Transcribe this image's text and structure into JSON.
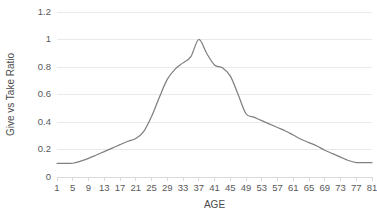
{
  "chart_data": {
    "type": "line",
    "title": "",
    "xlabel": "AGE",
    "ylabel": "Give vs Take Ratio",
    "xlim": [
      1,
      81
    ],
    "ylim": [
      0,
      1.2
    ],
    "grid": true,
    "legend": false,
    "legend_position": "none",
    "line_color": "#808080",
    "grid_color": "#e9e9e9",
    "background_color": "#ffffff",
    "ytick_labels": [
      "0",
      "0.2",
      "0.4",
      "0.6",
      "0.8",
      "1",
      "1.2"
    ],
    "ytick_values": [
      0,
      0.2,
      0.4,
      0.6,
      0.8,
      1,
      1.2
    ],
    "xtick_labels": [
      "1",
      "5",
      "9",
      "13",
      "17",
      "21",
      "25",
      "29",
      "33",
      "37",
      "41",
      "45",
      "49",
      "53",
      "57",
      "61",
      "65",
      "69",
      "73",
      "77",
      "81"
    ],
    "xtick_values": [
      1,
      5,
      9,
      13,
      17,
      21,
      25,
      29,
      33,
      37,
      41,
      45,
      49,
      53,
      57,
      61,
      65,
      69,
      73,
      77,
      81
    ],
    "series": [
      {
        "name": "Give vs Take Ratio",
        "x": [
          1,
          3,
          5,
          7,
          9,
          11,
          13,
          15,
          17,
          19,
          21,
          23,
          25,
          27,
          29,
          31,
          33,
          35,
          37,
          39,
          41,
          43,
          45,
          47,
          49,
          51,
          53,
          55,
          57,
          59,
          61,
          63,
          65,
          67,
          69,
          71,
          73,
          75,
          77,
          79,
          81
        ],
        "values": [
          0.1,
          0.1,
          0.1,
          0.115,
          0.135,
          0.16,
          0.185,
          0.21,
          0.235,
          0.26,
          0.28,
          0.33,
          0.44,
          0.58,
          0.71,
          0.785,
          0.83,
          0.875,
          1.0,
          0.9,
          0.815,
          0.795,
          0.735,
          0.6,
          0.46,
          0.435,
          0.41,
          0.385,
          0.36,
          0.335,
          0.305,
          0.275,
          0.25,
          0.225,
          0.195,
          0.17,
          0.145,
          0.12,
          0.105,
          0.105,
          0.105
        ]
      }
    ]
  },
  "axes": {
    "y_title": "Give vs Take Ratio",
    "x_title": "AGE"
  }
}
